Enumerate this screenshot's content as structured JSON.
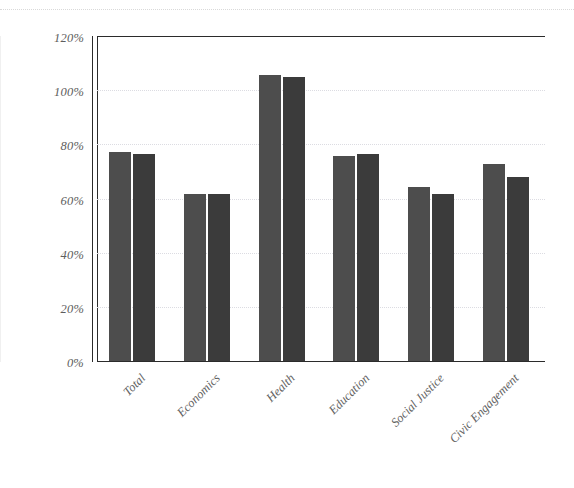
{
  "chart_data": {
    "type": "bar",
    "title": "",
    "subtitle": "",
    "xlabel": "",
    "ylabel": "",
    "categories": [
      "Total",
      "Economics",
      "Health",
      "Education",
      "Social Justice",
      "Civic Engagement"
    ],
    "series": [
      {
        "name": "Series 1",
        "color": "#4d4d4d",
        "values": [
          77.0,
          61.8,
          105.5,
          75.8,
          64.2,
          72.6
        ]
      },
      {
        "name": "Series 2",
        "color": "#3b3b3b",
        "values": [
          76.5,
          61.8,
          105.0,
          76.3,
          61.5,
          67.8
        ]
      }
    ],
    "ylim": [
      0,
      120
    ],
    "ytick_values": [
      0,
      20,
      40,
      60,
      80,
      100,
      120
    ],
    "ytick_labels": [
      "0%",
      "20%",
      "40%",
      "60%",
      "80%",
      "100%",
      "120%"
    ],
    "grid": true,
    "grid_axis": "y",
    "grid_color": "#dcdce2",
    "legend": "none",
    "xtick_rotation": -45,
    "axis_color": "#2b2b2b",
    "background": "#ffffff",
    "value_suffix": "%"
  },
  "axes": {
    "y_labels": [
      "120%",
      "100%",
      "80%",
      "60%",
      "40%",
      "20%",
      "0%"
    ],
    "x_labels": [
      "Total",
      "Economics",
      "Health",
      "Education",
      "Social Justice",
      "Civic Engagement"
    ]
  }
}
